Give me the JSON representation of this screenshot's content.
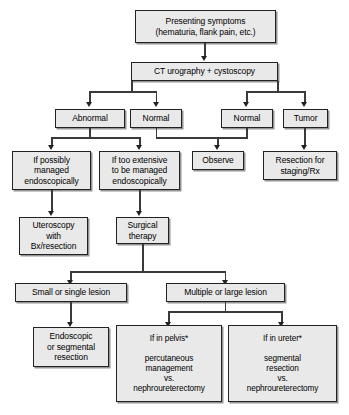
{
  "diagram": {
    "box_fill": "#e9e9e9",
    "box_border": "#222222",
    "line_color": "#3a3a3a",
    "nodes": {
      "presenting_symptoms": "Presenting symptoms\n(hematuria, flank pain, etc.)",
      "ct_urography": "CT urography + cystoscopy",
      "abnormal": "Abnormal",
      "normal_left": "Normal",
      "normal_right": "Normal",
      "tumor": "Tumor",
      "if_possibly_managed": "If possibly\nmanaged\nendoscopically",
      "if_too_extensive": "If too extensive\nto be managed\nendoscopically",
      "observe": "Observe",
      "resection_staging": "Resection for\nstaging/Rx",
      "uteroscopy": "Uteroscopy\nwith\nBx/resection",
      "surgical_therapy": "Surgical\ntherapy",
      "small_single_lesion": "Small or single lesion",
      "multiple_large_lesion": "Multiple or large lesion",
      "endoscopic_segmental": "Endoscopic\nor segmental\nresection",
      "if_in_pelvis": "If in pelvis*\n\npercutaneous\nmanagement\nvs.\nnephroureterectomy",
      "if_in_ureter": "If in ureter*\n\nsegmental\nresection\nvs.\nnephroureterectomy"
    }
  }
}
